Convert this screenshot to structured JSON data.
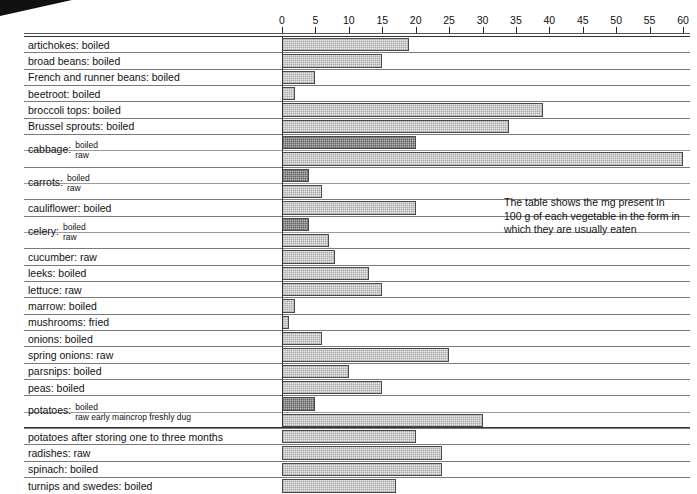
{
  "annotation": {
    "text": "The table shows the mg present in 100 g of each vegetable in the form in which they are usually eaten"
  },
  "chart_data": {
    "type": "bar",
    "orientation": "horizontal",
    "title": "",
    "xlabel": "",
    "ylabel": "",
    "xlim": [
      0,
      60
    ],
    "xticks": [
      0,
      5,
      10,
      15,
      20,
      25,
      30,
      35,
      40,
      45,
      50,
      55,
      60
    ],
    "grid": false,
    "legend": "none",
    "unit": "mg per 100 g",
    "categories": [
      "artichokes: boiled",
      "broad beans: boiled",
      "French and runner beans: boiled",
      "beetroot: boiled",
      "broccoli tops: boiled",
      "Brussel sprouts: boiled",
      "cabbage: boiled",
      "cabbage: raw",
      "carrots: boiled",
      "carrots: raw",
      "cauliflower: boiled",
      "celery: boiled",
      "celery: raw",
      "cucumber: raw",
      "leeks: boiled",
      "lettuce: raw",
      "marrow: boiled",
      "mushrooms: fried",
      "onions: boiled",
      "spring onions: raw",
      "parsnips: boiled",
      "peas: boiled",
      "potatoes: boiled",
      "potatoes: raw early maincrop freshly dug",
      "potatoes after storing one to three months",
      "radishes: raw",
      "spinach: boiled",
      "turnips and swedes: boiled"
    ],
    "values": [
      19,
      15,
      5,
      2,
      39,
      34,
      20,
      60,
      4,
      6,
      20,
      4,
      7,
      8,
      13,
      15,
      2,
      1,
      6,
      25,
      10,
      15,
      5,
      30,
      20,
      24,
      24,
      17
    ]
  },
  "axis": {
    "ticks": [
      {
        "label": "0",
        "value": 0
      },
      {
        "label": "5",
        "value": 5
      },
      {
        "label": "10",
        "value": 10
      },
      {
        "label": "15",
        "value": 15
      },
      {
        "label": "20",
        "value": 20
      },
      {
        "label": "25",
        "value": 25
      },
      {
        "label": "30",
        "value": 30
      },
      {
        "label": "35",
        "value": 35
      },
      {
        "label": "40",
        "value": 40
      },
      {
        "label": "45",
        "value": 45
      },
      {
        "label": "50",
        "value": 50
      },
      {
        "label": "55",
        "value": 55
      },
      {
        "label": "60",
        "value": 60
      }
    ]
  },
  "rows": [
    {
      "label": "artichokes: boiled",
      "value": 19,
      "shade": "light",
      "kind": "single"
    },
    {
      "label": "broad beans: boiled",
      "value": 15,
      "shade": "light",
      "kind": "single"
    },
    {
      "label": "French and runner beans: boiled",
      "value": 5,
      "shade": "light",
      "kind": "single"
    },
    {
      "label": "beetroot: boiled",
      "value": 2,
      "shade": "light",
      "kind": "single"
    },
    {
      "label": "broccoli tops: boiled",
      "value": 39,
      "shade": "light",
      "kind": "single"
    },
    {
      "label": "Brussel sprouts: boiled",
      "value": 34,
      "shade": "light",
      "kind": "single"
    },
    {
      "label": "cabbage:",
      "state": "boiled",
      "value": 20,
      "shade": "dark",
      "kind": "pair-top"
    },
    {
      "label": "",
      "state": "raw",
      "value": 60,
      "shade": "light",
      "kind": "pair-bottom"
    },
    {
      "label": "carrots:",
      "state": "boiled",
      "value": 4,
      "shade": "dark",
      "kind": "pair-top"
    },
    {
      "label": "",
      "state": "raw",
      "value": 6,
      "shade": "light",
      "kind": "pair-bottom"
    },
    {
      "label": "cauliflower: boiled",
      "value": 20,
      "shade": "light",
      "kind": "single"
    },
    {
      "label": "celery:",
      "state": "boiled",
      "value": 4,
      "shade": "dark",
      "kind": "pair-top"
    },
    {
      "label": "",
      "state": "raw",
      "value": 7,
      "shade": "light",
      "kind": "pair-bottom"
    },
    {
      "label": "cucumber: raw",
      "value": 8,
      "shade": "light",
      "kind": "single"
    },
    {
      "label": "leeks: boiled",
      "value": 13,
      "shade": "light",
      "kind": "single"
    },
    {
      "label": "lettuce: raw",
      "value": 15,
      "shade": "light",
      "kind": "single"
    },
    {
      "label": "marrow: boiled",
      "value": 2,
      "shade": "light",
      "kind": "single"
    },
    {
      "label": "mushrooms: fried",
      "value": 1,
      "shade": "light",
      "kind": "single"
    },
    {
      "label": "onions: boiled",
      "value": 6,
      "shade": "light",
      "kind": "single"
    },
    {
      "label": "spring onions: raw",
      "value": 25,
      "shade": "light",
      "kind": "single"
    },
    {
      "label": "parsnips: boiled",
      "value": 10,
      "shade": "light",
      "kind": "single"
    },
    {
      "label": "peas: boiled",
      "value": 15,
      "shade": "light",
      "kind": "single"
    },
    {
      "label": "potatoes:",
      "state": "boiled",
      "value": 5,
      "shade": "dark",
      "kind": "pair-top"
    },
    {
      "label": "",
      "state": "raw early maincrop freshly dug",
      "value": 30,
      "shade": "light",
      "kind": "pair-bottom"
    },
    {
      "label": "potatoes after storing one to three months",
      "value": 20,
      "shade": "light",
      "kind": "single"
    },
    {
      "label": "radishes: raw",
      "value": 24,
      "shade": "light",
      "kind": "single"
    },
    {
      "label": "spinach: boiled",
      "value": 24,
      "shade": "light",
      "kind": "single"
    },
    {
      "label": "turnips and swedes: boiled",
      "value": 17,
      "shade": "light",
      "kind": "single"
    }
  ]
}
